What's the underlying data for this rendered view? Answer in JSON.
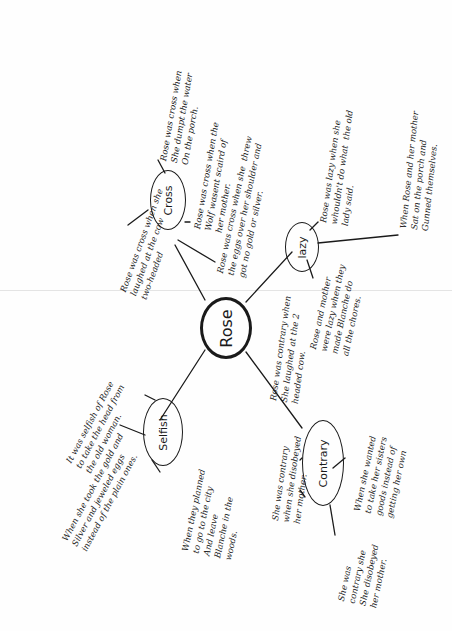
{
  "diagram": {
    "type": "mind-map",
    "center": {
      "label": "Rose"
    },
    "branches": [
      {
        "label": "Cross",
        "notes": [
          "Rose was cross when\nShe dumpt the water\nOn the porch.",
          "Rose was cross when the\nWolf wasent scaird of\nher mother.",
          "Rose was cross when she  threw\nthe eggs over her shoulder and\ngot no gold or silver.",
          "Rose was cross when she\nlaughed at the cow\ntwo-headed"
        ]
      },
      {
        "label": "lazy",
        "notes": [
          "Rose was lazy when she\nwhouldn't do what  the old\nlady said.",
          "When Rose and her mother\nSat on the porch and\nGunned themselves.",
          "Rose and mother\nwere lazy when they\nmade Blanche do\nall the chores."
        ]
      },
      {
        "label": "Selfish",
        "notes": [
          "When she took the gold and\nSilver and jeweled eggs\ninstead of the plain ones.",
          "It was selfish of Rose\nto take the head from\nthe old woman.",
          "When they planned\nto go to the city\nAnd leave\nBlanche in the\nwoods."
        ]
      },
      {
        "label": "Contrary",
        "notes": [
          "Rose was contrary when\nShe laughed at the 2\nheaded cow.",
          "She was contrary\nwhen she disobeyed\nher mother.",
          "When she wanted\nto take her sisters\ngoods instead of\ngetting her own",
          "She was\ncontrary she\nShe disobeyed\nher mother."
        ]
      }
    ]
  }
}
